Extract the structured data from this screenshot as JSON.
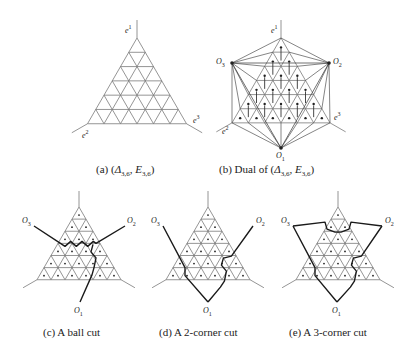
{
  "figure": {
    "n": 6,
    "panels": [
      {
        "id": "a",
        "caption": "(a) (Δ3,6, E3,6)",
        "caption_parts": {
          "prefix": "(a) (",
          "delta": "Δ",
          "delta_sub": "3,6",
          "sep": ", ",
          "e": "E",
          "e_sub": "3,6",
          "suffix": ")"
        },
        "apex": [
          137,
          38
        ],
        "side": 99,
        "type": "grid",
        "labels": {
          "e1": "e",
          "e1_sup": "1",
          "e2": "e",
          "e2_sup": "2",
          "e3": "e",
          "e3_sup": "3"
        }
      },
      {
        "id": "b",
        "caption": "(b) Dual of (Δ3,6, E3,6)",
        "caption_parts": {
          "prefix": "(b) Dual of (",
          "delta": "Δ",
          "delta_sub": "3,6",
          "sep": ", ",
          "e": "E",
          "e_sub": "3,6",
          "suffix": ")"
        },
        "apex": [
          281,
          38
        ],
        "side": 98,
        "type": "dual",
        "outer": {
          "O1": [
            281,
            148
          ],
          "O2": [
            329,
            63
          ],
          "O3": [
            232,
            63
          ]
        },
        "labels": {
          "O1": "O",
          "O1_sub": "1",
          "O2": "O",
          "O2_sub": "2",
          "O3": "O",
          "O3_sub": "3",
          "e1": "e",
          "e1_sup": "1",
          "e2": "e",
          "e2_sup": "2",
          "e3": "e",
          "e3_sup": "3"
        }
      },
      {
        "id": "c",
        "caption": "(c) A ball cut",
        "apex": [
          79,
          207
        ],
        "side": 84,
        "type": "cut",
        "outer": {
          "O1": [
            80,
            302
          ],
          "O2": [
            125,
            226
          ],
          "O3": [
            34,
            226
          ]
        },
        "labels": {
          "O1": "O",
          "O1_sub": "1",
          "O2": "O",
          "O2_sub": "2",
          "O3": "O",
          "O3_sub": "3"
        }
      },
      {
        "id": "d",
        "caption": "(d) A 2-corner cut",
        "apex": [
          208,
          207
        ],
        "side": 84,
        "type": "cut",
        "outer": {
          "O1": [
            208,
            302
          ],
          "O2": [
            253,
            226
          ],
          "O3": [
            163,
            226
          ]
        },
        "labels": {
          "O1": "O",
          "O1_sub": "1",
          "O2": "O",
          "O2_sub": "2",
          "O3": "O",
          "O3_sub": "3"
        }
      },
      {
        "id": "e",
        "caption": "(e) A 3-corner cut",
        "apex": [
          338,
          207
        ],
        "side": 84,
        "type": "cut",
        "outer": {
          "O1": [
            337,
            302
          ],
          "O2": [
            382,
            226
          ],
          "O3": [
            293,
            226
          ]
        },
        "labels": {
          "O1": "O",
          "O1_sub": "1",
          "O2": "O",
          "O2_sub": "2",
          "O3": "O",
          "O3_sub": "3"
        }
      }
    ],
    "colors": {
      "grid": "#7a7a7a",
      "cut": "#1a1a1a",
      "dot": "#222222",
      "text": "#222222"
    }
  }
}
